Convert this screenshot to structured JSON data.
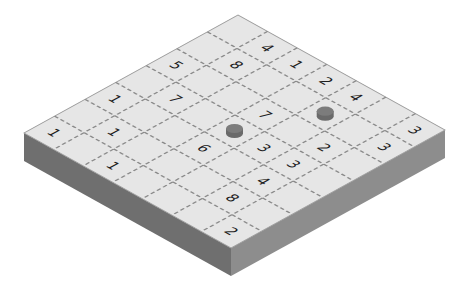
{
  "board": {
    "rows": 7,
    "cols": 7,
    "corners": {
      "top": [
        238,
        15
      ],
      "right": [
        445,
        130
      ],
      "bottom": [
        232,
        248
      ],
      "left": [
        24,
        133
      ]
    },
    "thickness": 28,
    "colors": {
      "top_face": "#e6e6e6",
      "left_face": "#6f6f6f",
      "right_face": "#8d8d8d",
      "edge": "#9a9a9a",
      "grid_dash": "#8a8a8a",
      "digit": "#1e1e1e",
      "peg_top": "#7c7c7c",
      "peg_side": "#6a6a6a"
    },
    "cells": [
      [
        "",
        "4",
        "1",
        "2",
        "4",
        "",
        "3"
      ],
      [
        "",
        "8",
        "",
        "",
        "",
        "",
        "3"
      ],
      [
        "5",
        "",
        "",
        "7",
        "",
        "2",
        ""
      ],
      [
        "",
        "7",
        "",
        "",
        "3",
        "3",
        ""
      ],
      [
        "1",
        "",
        "",
        "6",
        "",
        "4",
        ""
      ],
      [
        "",
        "1",
        "",
        "",
        "",
        "8",
        ""
      ],
      [
        "1",
        "",
        "1",
        "",
        "",
        "",
        "2"
      ]
    ],
    "pegs": [
      {
        "row": 1,
        "col": 4
      },
      {
        "row": 3,
        "col": 3
      }
    ]
  }
}
